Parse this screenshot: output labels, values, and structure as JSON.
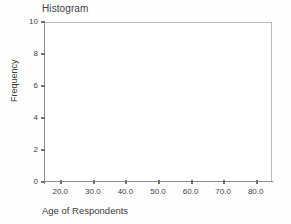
{
  "chart_data": {
    "type": "bar",
    "title": "Histogram",
    "xlabel": "Age of Respondents",
    "ylabel": "Frequency",
    "grid": false,
    "legend": false,
    "xlim": [
      15,
      85
    ],
    "ylim": [
      0,
      10
    ],
    "x_ticks": [
      "20.0",
      "30.0",
      "40.0",
      "50.0",
      "60.0",
      "70.0",
      "80.0"
    ],
    "x_tick_values": [
      20,
      30,
      40,
      50,
      60,
      70,
      80
    ],
    "y_ticks": [
      "0",
      "2",
      "4",
      "6",
      "8",
      "10"
    ],
    "y_tick_values": [
      0,
      2,
      4,
      6,
      8,
      10
    ],
    "categories": [],
    "values": [],
    "note": "plot area empty - no bars rendered"
  },
  "colors": {
    "frame": "#b9b9b9",
    "axis": "#8d8d8d",
    "tick": "#6f6f6f",
    "text": "#3a3a3a",
    "background": "#fefefe",
    "plot_background": "#ffffff"
  }
}
